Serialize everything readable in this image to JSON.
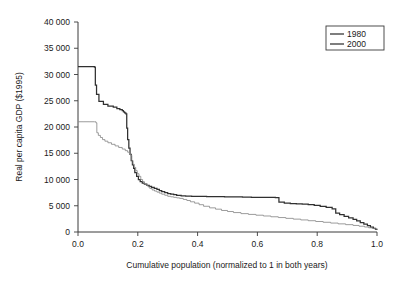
{
  "chart_data": {
    "type": "line",
    "title": "",
    "subtitle": "",
    "xlabel": "Cumulative population (normalized to 1 in both years)",
    "ylabel": "Real per capita GDP ($1995)",
    "xlim": [
      0.0,
      1.0
    ],
    "ylim": [
      0,
      40000
    ],
    "grid": false,
    "legend_position": "top-right",
    "xticks": [
      0.0,
      0.2,
      0.4,
      0.6,
      0.8,
      1.0
    ],
    "xtick_labels": [
      "0.0",
      "0.2",
      "0.4",
      "0.6",
      "0.8",
      "1.0"
    ],
    "yticks": [
      0,
      5000,
      10000,
      15000,
      20000,
      25000,
      30000,
      35000,
      40000
    ],
    "ytick_labels": [
      "0",
      "5 000",
      "10 000",
      "15 000",
      "20 000",
      "25 000",
      "30 000",
      "35 000",
      "40 000"
    ],
    "series": [
      {
        "name": "1980",
        "color": "#303030",
        "width": 1.25,
        "style": "step-post",
        "x": [
          0.0,
          0.02,
          0.04,
          0.052,
          0.055,
          0.058,
          0.062,
          0.07,
          0.085,
          0.1,
          0.118,
          0.13,
          0.14,
          0.148,
          0.152,
          0.156,
          0.16,
          0.163,
          0.166,
          0.17,
          0.174,
          0.178,
          0.182,
          0.186,
          0.19,
          0.196,
          0.202,
          0.208,
          0.215,
          0.222,
          0.23,
          0.238,
          0.246,
          0.255,
          0.264,
          0.272,
          0.28,
          0.29,
          0.3,
          0.31,
          0.32,
          0.33,
          0.345,
          0.36,
          0.38,
          0.4,
          0.43,
          0.46,
          0.49,
          0.52,
          0.55,
          0.58,
          0.61,
          0.64,
          0.66,
          0.672,
          0.69,
          0.71,
          0.73,
          0.75,
          0.77,
          0.79,
          0.81,
          0.83,
          0.85,
          0.862,
          0.875,
          0.89,
          0.905,
          0.92,
          0.932,
          0.944,
          0.956,
          0.968,
          0.978,
          0.988,
          0.995,
          1.0
        ],
        "y": [
          31500,
          31500,
          31500,
          31500,
          31400,
          28000,
          26200,
          24900,
          24300,
          24000,
          23800,
          23500,
          23300,
          23100,
          22900,
          22700,
          22500,
          19800,
          17600,
          16000,
          14800,
          13600,
          12800,
          12100,
          11300,
          10600,
          10000,
          9600,
          9300,
          9100,
          8900,
          8700,
          8500,
          8300,
          8100,
          7900,
          7700,
          7500,
          7300,
          7200,
          7100,
          7000,
          6900,
          6850,
          6800,
          6780,
          6750,
          6720,
          6700,
          6680,
          6650,
          6620,
          6600,
          6580,
          6560,
          5700,
          5500,
          5400,
          5350,
          5300,
          5200,
          5050,
          4900,
          4700,
          4400,
          3600,
          3300,
          3000,
          2700,
          2400,
          2100,
          1800,
          1500,
          1200,
          950,
          700,
          520,
          430
        ],
        "annotations": [
          {
            "label": "plateau at top",
            "x": 0.03,
            "y": 31500
          },
          {
            "label": "first major drop",
            "x": 0.055,
            "y": 31500
          },
          {
            "label": "crossing with 2000 series",
            "x": 0.185,
            "y": 11800
          },
          {
            "label": "right endpoint",
            "x": 1.0,
            "y": 430
          }
        ]
      },
      {
        "name": "2000",
        "color": "#8a8a8a",
        "width": 0.85,
        "style": "step-post",
        "x": [
          0.0,
          0.02,
          0.04,
          0.055,
          0.06,
          0.063,
          0.068,
          0.075,
          0.082,
          0.09,
          0.1,
          0.112,
          0.124,
          0.136,
          0.148,
          0.158,
          0.166,
          0.172,
          0.176,
          0.18,
          0.184,
          0.188,
          0.193,
          0.198,
          0.204,
          0.21,
          0.216,
          0.222,
          0.228,
          0.234,
          0.24,
          0.248,
          0.256,
          0.264,
          0.272,
          0.28,
          0.29,
          0.3,
          0.31,
          0.32,
          0.33,
          0.34,
          0.352,
          0.364,
          0.376,
          0.39,
          0.405,
          0.42,
          0.44,
          0.46,
          0.48,
          0.5,
          0.52,
          0.545,
          0.57,
          0.595,
          0.62,
          0.645,
          0.67,
          0.695,
          0.72,
          0.745,
          0.77,
          0.795,
          0.82,
          0.845,
          0.87,
          0.895,
          0.92,
          0.94,
          0.958,
          0.972,
          0.984,
          0.993,
          1.0
        ],
        "y": [
          21000,
          21000,
          21000,
          21000,
          20800,
          18900,
          18400,
          18000,
          17600,
          17300,
          17000,
          16700,
          16400,
          16100,
          15800,
          15500,
          15200,
          14900,
          14600,
          13600,
          12900,
          12300,
          11700,
          11100,
          10600,
          10000,
          9600,
          9200,
          8900,
          8600,
          8300,
          8000,
          7800,
          7600,
          7400,
          7200,
          7000,
          6800,
          6700,
          6600,
          6500,
          6400,
          6200,
          6000,
          5750,
          5500,
          5200,
          4900,
          4600,
          4350,
          4100,
          3900,
          3700,
          3500,
          3350,
          3200,
          3050,
          2900,
          2750,
          2600,
          2450,
          2300,
          2150,
          2000,
          1850,
          1700,
          1550,
          1400,
          1250,
          1100,
          950,
          800,
          680,
          580,
          520
        ],
        "annotations": [
          {
            "label": "plateau at top",
            "x": 0.03,
            "y": 21000
          },
          {
            "label": "first major drop",
            "x": 0.06,
            "y": 21000
          },
          {
            "label": "crossing with 1980 series",
            "x": 0.185,
            "y": 12500
          },
          {
            "label": "right endpoint",
            "x": 1.0,
            "y": 520
          }
        ]
      }
    ],
    "legend_entries": [
      {
        "label": "1980",
        "color": "#303030"
      },
      {
        "label": "2000",
        "color": "#8a8a8a"
      }
    ]
  },
  "figure": {
    "background": "#ffffff",
    "axis_color": "#3a3a3a"
  }
}
